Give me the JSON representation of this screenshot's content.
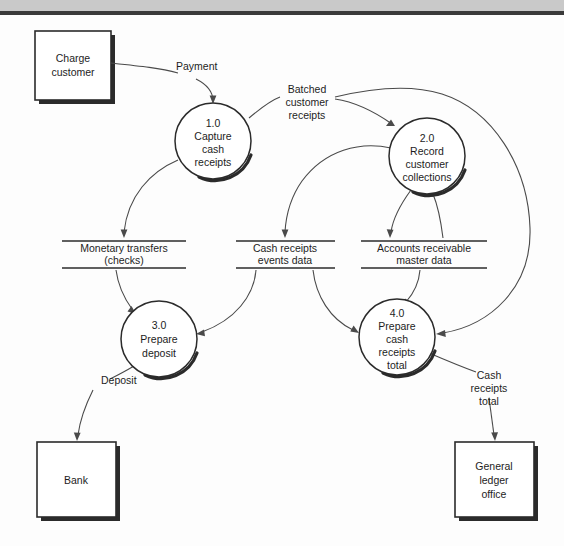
{
  "diagram": {
    "type": "data-flow-diagram",
    "entities": [
      {
        "id": "charge-customer",
        "label_lines": [
          "Charge",
          "customer"
        ],
        "x": 35,
        "y": 31,
        "w": 76,
        "h": 69
      },
      {
        "id": "bank",
        "label_lines": [
          "Bank"
        ],
        "x": 37,
        "y": 442,
        "w": 79,
        "h": 75
      },
      {
        "id": "general-ledger-office",
        "label_lines": [
          "General",
          "ledger",
          "office"
        ],
        "x": 455,
        "y": 442,
        "w": 79,
        "h": 75
      }
    ],
    "processes": [
      {
        "id": "p1",
        "number": "1.0",
        "label_lines": [
          "1.0",
          "Capture",
          "cash",
          "receipts"
        ],
        "cx": 213,
        "cy": 141,
        "r": 38
      },
      {
        "id": "p2",
        "number": "2.0",
        "label_lines": [
          "2.0",
          "Record",
          "customer",
          "collections"
        ],
        "cx": 427,
        "cy": 156,
        "r": 38
      },
      {
        "id": "p3",
        "number": "3.0",
        "label_lines": [
          "3.0",
          "Prepare",
          "deposit"
        ],
        "cx": 159,
        "cy": 339,
        "r": 38
      },
      {
        "id": "p4",
        "number": "4.0",
        "label_lines": [
          "4.0",
          "Prepare",
          "cash",
          "receipts",
          "total"
        ],
        "cx": 397,
        "cy": 337,
        "r": 38
      }
    ],
    "data_stores": [
      {
        "id": "ds-monetary-transfers",
        "label_lines": [
          "Monetary transfers",
          "(checks)"
        ],
        "x1": 62,
        "x2": 186,
        "y_top": 241,
        "y_bottom": 268
      },
      {
        "id": "ds-cash-receipts-events",
        "label_lines": [
          "Cash receipts",
          "events data"
        ],
        "x1": 236,
        "x2": 335,
        "y_top": 241,
        "y_bottom": 268
      },
      {
        "id": "ds-accounts-receivable",
        "label_lines": [
          "Accounts receivable",
          "master data"
        ],
        "x1": 361,
        "x2": 487,
        "y_top": 241,
        "y_bottom": 268
      }
    ],
    "flows": [
      {
        "id": "flow-payment",
        "label_lines": [
          "Payment"
        ],
        "label_x": 176,
        "label_y": 70,
        "from": "charge-customer",
        "to": "p1"
      },
      {
        "id": "flow-batched-customer-receipts",
        "label_lines": [
          "Batched",
          "customer",
          "receipts"
        ],
        "label_x": 306,
        "label_y": 93,
        "from": "p1",
        "to": "p2"
      },
      {
        "id": "flow-p1-to-monetary-transfers",
        "label_lines": [],
        "from": "p1",
        "to": "ds-monetary-transfers"
      },
      {
        "id": "flow-p2-to-cash-receipts-events",
        "label_lines": [],
        "from": "p2",
        "to": "ds-cash-receipts-events"
      },
      {
        "id": "flow-p2-to-accounts-receivable",
        "label_lines": [],
        "from": "p2",
        "to": "ds-accounts-receivable"
      },
      {
        "id": "flow-accounts-receivable-to-p2",
        "label_lines": [],
        "from": "ds-accounts-receivable",
        "to": "p2"
      },
      {
        "id": "flow-monetary-transfers-to-p3",
        "label_lines": [],
        "from": "ds-monetary-transfers",
        "to": "p3"
      },
      {
        "id": "flow-cash-receipts-events-to-p3",
        "label_lines": [],
        "from": "ds-cash-receipts-events",
        "to": "p3"
      },
      {
        "id": "flow-cash-receipts-events-to-p4",
        "label_lines": [],
        "from": "ds-cash-receipts-events",
        "to": "p4"
      },
      {
        "id": "flow-accounts-receivable-to-p4",
        "label_lines": [],
        "from": "ds-accounts-receivable",
        "to": "p4"
      },
      {
        "id": "flow-batched-receipts-to-p4",
        "label_lines": [],
        "from": "p1",
        "to": "p4"
      },
      {
        "id": "flow-deposit",
        "label_lines": [
          "Deposit"
        ],
        "label_x": 101,
        "label_y": 384,
        "from": "p3",
        "to": "bank"
      },
      {
        "id": "flow-cash-receipts-total",
        "label_lines": [
          "Cash",
          "receipts",
          "total"
        ],
        "label_x": 489,
        "label_y": 379,
        "from": "p4",
        "to": "general-ledger-office"
      }
    ]
  },
  "labels": {
    "charge_customer_1": "Charge",
    "charge_customer_2": "customer",
    "bank_1": "Bank",
    "gl_1": "General",
    "gl_2": "ledger",
    "gl_3": "office",
    "p1_1": "1.0",
    "p1_2": "Capture",
    "p1_3": "cash",
    "p1_4": "receipts",
    "p2_1": "2.0",
    "p2_2": "Record",
    "p2_3": "customer",
    "p2_4": "collections",
    "p3_1": "3.0",
    "p3_2": "Prepare",
    "p3_3": "deposit",
    "p4_1": "4.0",
    "p4_2": "Prepare",
    "p4_3": "cash",
    "p4_4": "receipts",
    "p4_5": "total",
    "ds1_1": "Monetary transfers",
    "ds1_2": "(checks)",
    "ds2_1": "Cash receipts",
    "ds2_2": "events data",
    "ds3_1": "Accounts receivable",
    "ds3_2": "master data",
    "payment": "Payment",
    "batched_1": "Batched",
    "batched_2": "customer",
    "batched_3": "receipts",
    "deposit": "Deposit",
    "crt_1": "Cash",
    "crt_2": "receipts",
    "crt_3": "total"
  },
  "colors": {
    "ink": "#2b2b2b",
    "flow": "#4a4a4a",
    "paper": "#fdfdfd",
    "page_edge": "#c9c9c9",
    "page_rule": "#3a3a3a"
  }
}
